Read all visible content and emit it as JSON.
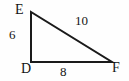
{
  "figure": {
    "kind": "right-triangle-diagram",
    "background_color": "#fefefe",
    "stroke_color": "#1a1a1a",
    "text_color": "#141414",
    "width": 129,
    "height": 81
  },
  "vertices": {
    "top_left": {
      "label": "E",
      "x": 31,
      "y": 12
    },
    "bottom_left": {
      "label": "D",
      "x": 31,
      "y": 62
    },
    "bottom_right": {
      "label": "F",
      "x": 112,
      "y": 62
    }
  },
  "sides": {
    "vertical": {
      "label": "6",
      "from": "D",
      "to": "E"
    },
    "horizontal": {
      "label": "8",
      "from": "D",
      "to": "F"
    },
    "hypotenuse": {
      "label": "10",
      "from": "E",
      "to": "F"
    }
  }
}
